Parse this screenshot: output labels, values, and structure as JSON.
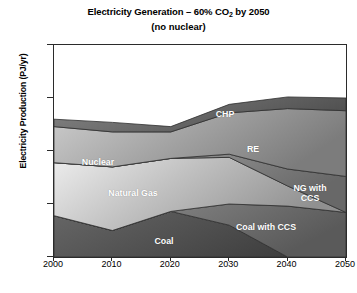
{
  "chart_data": {
    "type": "area",
    "stacked": true,
    "title": "Electricity Generation – 60% CO2 by 2050",
    "title_main": "Electricity Generation – 60% CO",
    "title_sub": "2",
    "title_tail": " by 2050",
    "subtitle": "(no nuclear)",
    "xlabel": "",
    "ylabel": "Electricity Production (PJ/yr)",
    "x": [
      2000,
      2010,
      2020,
      2030,
      2040,
      2050
    ],
    "xlim": [
      2000,
      2050
    ],
    "ylim": [
      0,
      2000
    ],
    "xticks": [
      "2000",
      "2010",
      "2020",
      "2030",
      "2040",
      "2050"
    ],
    "yticks": [
      "0",
      "500",
      "1000",
      "1500",
      "2000"
    ],
    "grid": false,
    "legend": "none (direct band labels)",
    "stack_order_bottom_to_top": [
      "Coal",
      "Coal with CCS",
      "Natural Gas",
      "NG with CCS",
      "RE",
      "CHP"
    ],
    "series": [
      {
        "name": "Coal",
        "label": "Coal",
        "color": "#545454",
        "values": [
          390,
          250,
          430,
          300,
          0,
          0
        ]
      },
      {
        "name": "Coal with CCS",
        "label": "Coal with CCS",
        "color": "#7a7a7a",
        "values": [
          0,
          0,
          0,
          200,
          480,
          420
        ]
      },
      {
        "name": "Natural Gas",
        "label": "Natural Gas",
        "color": "#c2c2c2",
        "values": [
          500,
          600,
          500,
          440,
          190,
          0
        ]
      },
      {
        "name": "NG with CCS",
        "label": "NG with CCS",
        "color": "#8d8d8d",
        "values": [
          0,
          0,
          0,
          30,
          160,
          340
        ]
      },
      {
        "name": "RE",
        "label": "RE",
        "color": "#a8a8a8",
        "values": [
          340,
          330,
          250,
          390,
          570,
          620
        ]
      },
      {
        "name": "CHP",
        "label": "CHP",
        "color": "#6e6e6e",
        "values": [
          70,
          90,
          50,
          80,
          110,
          120
        ]
      }
    ],
    "annotations": [
      {
        "text": "Nuclear",
        "note": "early-years portion of upper band, left side"
      },
      {
        "text": "RE",
        "note": "upper band, right side"
      },
      {
        "text": "CHP",
        "note": "topmost thin band"
      },
      {
        "text": "Natural Gas",
        "note": "mid band, left"
      },
      {
        "text": "NG with\nCCS",
        "note": "band wedge, right"
      },
      {
        "text": "Coal",
        "note": "bottom band, left"
      },
      {
        "text": "Coal with CCS",
        "note": "bottom-right wedge"
      }
    ],
    "band_labels": [
      {
        "name": "Nuclear",
        "text": "Nuclear",
        "x": 14,
        "y": 112,
        "w": 60
      },
      {
        "name": "CHP",
        "text": "CHP",
        "x": 154,
        "y": 64,
        "w": 34
      },
      {
        "name": "RE",
        "text": "RE",
        "x": 188,
        "y": 99,
        "w": 22
      },
      {
        "name": "NG with CCS",
        "text": "NG with\nCCS",
        "x": 228,
        "y": 138,
        "w": 56
      },
      {
        "name": "Natural Gas",
        "text": "Natural Gas",
        "x": 40,
        "y": 143,
        "w": 78
      },
      {
        "name": "Coal with CCS",
        "text": "Coal with CCS",
        "x": 170,
        "y": 177,
        "w": 84
      },
      {
        "name": "Coal",
        "text": "Coal",
        "x": 93,
        "y": 191,
        "w": 34
      }
    ]
  }
}
